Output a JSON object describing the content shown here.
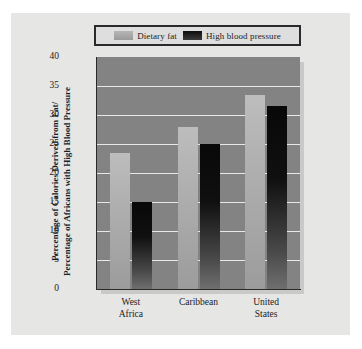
{
  "chart_data": {
    "type": "bar",
    "title": "",
    "xlabel": "",
    "ylabel": "Percentage of Calories Derived from Fat/ Percentage of Africans with High Blood Pressure",
    "ylabel_lines": [
      "Percentage of Calories Derived from Fat/",
      "Percentage of Africans with High Blood Pressure"
    ],
    "categories": [
      "West Africa",
      "Caribbean",
      "United States"
    ],
    "category_lines": [
      [
        "West",
        "Africa"
      ],
      [
        "Caribbean"
      ],
      [
        "United",
        "States"
      ]
    ],
    "series": [
      {
        "name": "Dietary fat",
        "values": [
          23.5,
          28.0,
          33.5
        ]
      },
      {
        "name": "High blood pressure",
        "values": [
          15.0,
          25.0,
          31.5
        ]
      }
    ],
    "ylim": [
      0,
      40
    ],
    "ytick_step": 5,
    "ytick_labels": [
      "40",
      "35",
      "30",
      "25",
      "20",
      "15",
      "10",
      "5",
      "0"
    ],
    "ytick_values": [
      40,
      35,
      30,
      25,
      20,
      15,
      10,
      5,
      0
    ],
    "grid": true,
    "legend_position": "top",
    "legend": [
      {
        "label": "Dietary fat",
        "swatch": "light"
      },
      {
        "label": "High blood pressure",
        "swatch": "dark"
      }
    ],
    "colors": {
      "series_light": "#b0b0b0",
      "series_dark": "#101010",
      "plot_background": "#838383",
      "gridline": "#e8e8e8",
      "card_background": "#e6e6e4",
      "axis": "#2a2a2a",
      "text": "#1c1c1c"
    }
  }
}
